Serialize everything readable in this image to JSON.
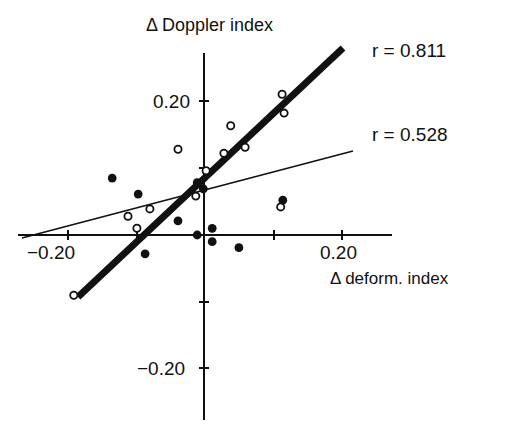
{
  "chart_data": {
    "type": "scatter",
    "title": "",
    "xlabel": "Δ deform. index",
    "ylabel": "Δ Doppler index",
    "xlim": [
      -0.27,
      0.27
    ],
    "ylim": [
      -0.28,
      0.28
    ],
    "grid": false,
    "legend": null,
    "x_ticks": [
      -0.2,
      -0.1,
      0.0,
      0.1,
      0.2
    ],
    "y_ticks": [
      -0.2,
      -0.1,
      0.0,
      0.1,
      0.2
    ],
    "x_tick_labels": [
      {
        "value": -0.2,
        "label": "−0.20"
      },
      {
        "value": 0.2,
        "label": "0.20"
      }
    ],
    "y_tick_labels": [
      {
        "value": 0.2,
        "label": "0.20"
      },
      {
        "value": -0.2,
        "label": "−0.20"
      }
    ],
    "series": [
      {
        "name": "open circles",
        "marker": "open-circle",
        "points": [
          {
            "x": -0.19,
            "y": -0.09
          },
          {
            "x": -0.111,
            "y": 0.028
          },
          {
            "x": -0.079,
            "y": 0.039
          },
          {
            "x": -0.098,
            "y": 0.01
          },
          {
            "x": -0.038,
            "y": 0.128
          },
          {
            "x": -0.012,
            "y": 0.058
          },
          {
            "x": 0.003,
            "y": 0.096
          },
          {
            "x": 0.029,
            "y": 0.122
          },
          {
            "x": 0.039,
            "y": 0.163
          },
          {
            "x": 0.06,
            "y": 0.131
          },
          {
            "x": 0.114,
            "y": 0.21
          },
          {
            "x": 0.117,
            "y": 0.182
          },
          {
            "x": 0.112,
            "y": 0.042
          }
        ]
      },
      {
        "name": "filled circles",
        "marker": "filled-circle",
        "points": [
          {
            "x": -0.134,
            "y": 0.085
          },
          {
            "x": -0.096,
            "y": 0.061
          },
          {
            "x": -0.086,
            "y": -0.028
          },
          {
            "x": -0.038,
            "y": 0.021
          },
          {
            "x": -0.01,
            "y": 0.078
          },
          {
            "x": -0.001,
            "y": 0.069
          },
          {
            "x": -0.01,
            "y": 0.0
          },
          {
            "x": 0.012,
            "y": 0.01
          },
          {
            "x": 0.012,
            "y": -0.01
          },
          {
            "x": 0.051,
            "y": -0.019
          },
          {
            "x": 0.115,
            "y": 0.052
          }
        ]
      }
    ],
    "regression_lines": [
      {
        "label": "r = 0.811",
        "style": "thick",
        "from": {
          "x": -0.184,
          "y": -0.093
        },
        "to": {
          "x": 0.203,
          "y": 0.279
        }
      },
      {
        "label": "r = 0.528",
        "style": "thin",
        "from": {
          "x": -0.266,
          "y": -0.004
        },
        "to": {
          "x": 0.218,
          "y": 0.125
        }
      }
    ],
    "annotations": [
      {
        "text": "r = 0.811",
        "near": "thick regression line end"
      },
      {
        "text": "r = 0.528",
        "near": "thin regression line end"
      }
    ]
  },
  "labels": {
    "ylabel": "Δ Doppler index",
    "xlabel": "Δ deform. index",
    "r_thick": "r = 0.811",
    "r_thin": "r = 0.528",
    "xtick_neg": "−0.20",
    "xtick_pos": "0.20",
    "ytick_pos": "0.20",
    "ytick_neg": "−0.20"
  }
}
